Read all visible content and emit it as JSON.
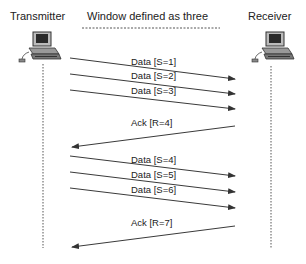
{
  "diagram": {
    "left_actor": "Transmitter",
    "right_actor": "Receiver",
    "caption": "Window defined as three",
    "left_icon": "computer-icon",
    "right_icon": "computer-icon",
    "messages": [
      {
        "label": "Data [S=1]",
        "direction": "right",
        "x1": 70,
        "y1": 58,
        "x2": 235,
        "y2": 79,
        "lx": 131,
        "ly": 56
      },
      {
        "label": "Data [S=2]",
        "direction": "right",
        "x1": 70,
        "y1": 74,
        "x2": 235,
        "y2": 94,
        "lx": 131,
        "ly": 70
      },
      {
        "label": "Data [S=3]",
        "direction": "right",
        "x1": 70,
        "y1": 90,
        "x2": 235,
        "y2": 109,
        "lx": 131,
        "ly": 85
      },
      {
        "label": "Ack [R=4]",
        "direction": "left",
        "x1": 235,
        "y1": 126,
        "x2": 72,
        "y2": 147,
        "lx": 131,
        "ly": 117
      },
      {
        "label": "Data [S=4]",
        "direction": "right",
        "x1": 70,
        "y1": 156,
        "x2": 235,
        "y2": 176,
        "lx": 131,
        "ly": 154
      },
      {
        "label": "Data [S=5]",
        "direction": "right",
        "x1": 70,
        "y1": 172,
        "x2": 235,
        "y2": 192,
        "lx": 131,
        "ly": 169
      },
      {
        "label": "Data [S=6]",
        "direction": "right",
        "x1": 70,
        "y1": 188,
        "x2": 235,
        "y2": 208,
        "lx": 131,
        "ly": 184
      },
      {
        "label": "Ack [R=7]",
        "direction": "left",
        "x1": 235,
        "y1": 226,
        "x2": 72,
        "y2": 247,
        "lx": 131,
        "ly": 217
      }
    ],
    "colors": {
      "line": "#3a3a3a",
      "text": "#222222",
      "lifeline": "#555555"
    }
  }
}
